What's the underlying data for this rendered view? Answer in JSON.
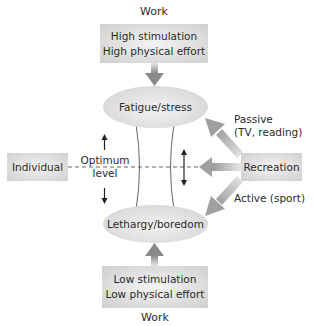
{
  "diagram": {
    "top_work": {
      "caption": "Work",
      "line1": "High stimulation",
      "line2": "High physical effort"
    },
    "fatigue": {
      "label": "Fatigue/stress"
    },
    "lethargy": {
      "label": "Lethargy/boredom"
    },
    "bottom_work": {
      "caption": "Work",
      "line1": "Low stimulation",
      "line2": "Low physical effort"
    },
    "individual": {
      "label": "Individual"
    },
    "optimum": {
      "line1": "Optimum",
      "line2": "level"
    },
    "recreation": {
      "label": "Recreation"
    },
    "passive": {
      "line1": "Passive",
      "line2": "(TV, reading)"
    },
    "active": {
      "label": "Active (sport)"
    },
    "colors": {
      "box_fill": "#d9d9d9",
      "arrow_fill": "#a8a8a8",
      "line": "#555555",
      "text": "#2a2a2a"
    }
  }
}
